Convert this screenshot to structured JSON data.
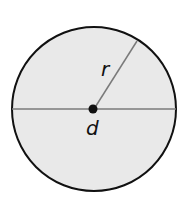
{
  "diagram": {
    "labels": {
      "radius": "r",
      "diameter": "d"
    },
    "colors": {
      "fill": "#e9e9e9",
      "stroke": "#111111",
      "line": "#7a7a7a",
      "center_dot": "#111111"
    },
    "shapes": {
      "circle": {
        "cx": 94,
        "cy": 109,
        "r": 82
      },
      "diameter_line": {
        "x1": 12,
        "y1": 109,
        "x2": 176,
        "y2": 109
      },
      "radius_line": {
        "x1": 94,
        "y1": 109,
        "x2": 137,
        "y2": 41
      },
      "center_dot": {
        "cx": 93,
        "cy": 109,
        "r": 4.5
      }
    }
  }
}
